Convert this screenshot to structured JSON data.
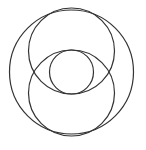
{
  "diagram": {
    "background": "#ffffff",
    "stroke_color": "#333333",
    "stroke_width": 1.2,
    "circles": [
      {
        "id": "outer-circle",
        "cx": 71.5,
        "cy": 72,
        "r": 62
      },
      {
        "id": "upper-circle",
        "cx": 71.5,
        "cy": 51,
        "r": 43
      },
      {
        "id": "lower-circle",
        "cx": 71.5,
        "cy": 93,
        "r": 43
      },
      {
        "id": "inner-circle",
        "cx": 71.5,
        "cy": 72,
        "r": 22
      }
    ]
  }
}
